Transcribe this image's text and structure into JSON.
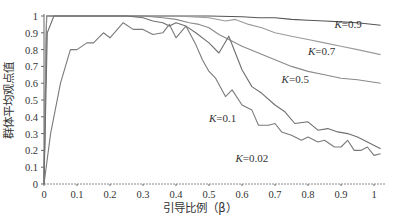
{
  "chart_data": {
    "type": "line",
    "title": "",
    "xlabel": "引导比例（β）",
    "ylabel": "群体平均观点值",
    "xlim": [
      0,
      1.02
    ],
    "ylim": [
      0,
      1
    ],
    "grid": false,
    "x_ticks": [
      "0",
      "0.1",
      "0.2",
      "0.3",
      "0.4",
      "0.5",
      "0.6",
      "0.7",
      "0.8",
      "0.9",
      "1"
    ],
    "y_ticks": [
      "0",
      "0.1",
      "0.2",
      "0.3",
      "0.4",
      "0.5",
      "0.6",
      "0.7",
      "0.8",
      "0.9",
      "1"
    ],
    "series": [
      {
        "name": "K=0.9",
        "label_pos": [
          0.88,
          0.93
        ],
        "color": "#555555",
        "points": [
          [
            0,
            0
          ],
          [
            0.008,
            1.0
          ],
          [
            0.3,
            1.0
          ],
          [
            0.5,
            1.0
          ],
          [
            0.6,
            0.995
          ],
          [
            0.65,
            0.99
          ],
          [
            0.7,
            0.99
          ],
          [
            0.75,
            0.98
          ],
          [
            0.8,
            0.975
          ],
          [
            0.85,
            0.97
          ],
          [
            0.9,
            0.965
          ],
          [
            0.95,
            0.96
          ],
          [
            1.02,
            0.945
          ]
        ]
      },
      {
        "name": "K=0.7",
        "label_pos": [
          0.8,
          0.77
        ],
        "color": "#9a9a9a",
        "points": [
          [
            0,
            0
          ],
          [
            0.008,
            1.0
          ],
          [
            0.4,
            1.0
          ],
          [
            0.5,
            0.99
          ],
          [
            0.55,
            0.97
          ],
          [
            0.58,
            0.98
          ],
          [
            0.62,
            0.95
          ],
          [
            0.66,
            0.93
          ],
          [
            0.7,
            0.9
          ],
          [
            0.75,
            0.88
          ],
          [
            0.8,
            0.86
          ],
          [
            0.85,
            0.84
          ],
          [
            0.9,
            0.82
          ],
          [
            0.95,
            0.8
          ],
          [
            1.02,
            0.77
          ]
        ]
      },
      {
        "name": "K=0.5",
        "label_pos": [
          0.72,
          0.6
        ],
        "color": "#8a8a8a",
        "points": [
          [
            0,
            0
          ],
          [
            0.008,
            1.0
          ],
          [
            0.3,
            1.0
          ],
          [
            0.36,
            0.99
          ],
          [
            0.4,
            0.98
          ],
          [
            0.44,
            0.96
          ],
          [
            0.47,
            0.95
          ],
          [
            0.5,
            0.93
          ],
          [
            0.53,
            0.89
          ],
          [
            0.56,
            0.86
          ],
          [
            0.6,
            0.82
          ],
          [
            0.65,
            0.78
          ],
          [
            0.7,
            0.74
          ],
          [
            0.75,
            0.7
          ],
          [
            0.8,
            0.67
          ],
          [
            0.85,
            0.65
          ],
          [
            0.9,
            0.63
          ],
          [
            0.95,
            0.62
          ],
          [
            1.02,
            0.6
          ]
        ]
      },
      {
        "name": "K=0.1",
        "label_pos": [
          0.5,
          0.37
        ],
        "color": "#6f6f6f",
        "points": [
          [
            0,
            0
          ],
          [
            0.01,
            0.9
          ],
          [
            0.03,
            1.0
          ],
          [
            0.25,
            1.0
          ],
          [
            0.3,
            0.99
          ],
          [
            0.33,
            0.97
          ],
          [
            0.36,
            0.96
          ],
          [
            0.38,
            0.94
          ],
          [
            0.4,
            0.96
          ],
          [
            0.43,
            0.94
          ],
          [
            0.46,
            0.9
          ],
          [
            0.5,
            0.84
          ],
          [
            0.53,
            0.78
          ],
          [
            0.56,
            0.88
          ],
          [
            0.6,
            0.68
          ],
          [
            0.63,
            0.58
          ],
          [
            0.66,
            0.54
          ],
          [
            0.7,
            0.47
          ],
          [
            0.73,
            0.43
          ],
          [
            0.76,
            0.36
          ],
          [
            0.8,
            0.37
          ],
          [
            0.83,
            0.32
          ],
          [
            0.86,
            0.33
          ],
          [
            0.89,
            0.31
          ],
          [
            0.92,
            0.3
          ],
          [
            0.95,
            0.28
          ],
          [
            0.98,
            0.25
          ],
          [
            1.02,
            0.21
          ]
        ]
      },
      {
        "name": "K=0.02",
        "label_pos": [
          0.58,
          0.13
        ],
        "color": "#7a7a7a",
        "points": [
          [
            0,
            0
          ],
          [
            0.02,
            0.3
          ],
          [
            0.05,
            0.6
          ],
          [
            0.08,
            0.8
          ],
          [
            0.1,
            0.8
          ],
          [
            0.13,
            0.84
          ],
          [
            0.15,
            0.84
          ],
          [
            0.18,
            0.9
          ],
          [
            0.2,
            0.87
          ],
          [
            0.24,
            0.96
          ],
          [
            0.27,
            0.92
          ],
          [
            0.3,
            0.92
          ],
          [
            0.33,
            0.89
          ],
          [
            0.36,
            0.9
          ],
          [
            0.38,
            0.95
          ],
          [
            0.4,
            0.87
          ],
          [
            0.43,
            0.94
          ],
          [
            0.46,
            0.83
          ],
          [
            0.48,
            0.74
          ],
          [
            0.5,
            0.67
          ],
          [
            0.52,
            0.63
          ],
          [
            0.55,
            0.52
          ],
          [
            0.57,
            0.56
          ],
          [
            0.6,
            0.47
          ],
          [
            0.63,
            0.44
          ],
          [
            0.65,
            0.35
          ],
          [
            0.68,
            0.35
          ],
          [
            0.7,
            0.36
          ],
          [
            0.72,
            0.31
          ],
          [
            0.75,
            0.29
          ],
          [
            0.78,
            0.26
          ],
          [
            0.8,
            0.28
          ],
          [
            0.83,
            0.25
          ],
          [
            0.85,
            0.26
          ],
          [
            0.88,
            0.22
          ],
          [
            0.9,
            0.22
          ],
          [
            0.92,
            0.26
          ],
          [
            0.94,
            0.2
          ],
          [
            0.96,
            0.2
          ],
          [
            0.98,
            0.22
          ],
          [
            1.0,
            0.17
          ],
          [
            1.02,
            0.18
          ]
        ]
      }
    ]
  }
}
